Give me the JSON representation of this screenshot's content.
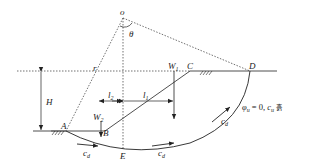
{
  "diagram": {
    "points": {
      "O": {
        "label": "o",
        "x": 123,
        "y": 18
      },
      "A": {
        "label": "A",
        "x": 66,
        "y": 131
      },
      "B": {
        "label": "B",
        "x": 105,
        "y": 131
      },
      "C": {
        "label": "C",
        "x": 190,
        "y": 71
      },
      "D": {
        "label": "D",
        "x": 250,
        "y": 71
      },
      "E": {
        "label": "E",
        "x": 123,
        "y": 150
      }
    },
    "labels": {
      "theta": "θ",
      "radius": "r",
      "height": "H",
      "w1_main": "W",
      "w1_sub": "1",
      "w2_main": "W",
      "w2_sub": "2",
      "l1_main": "l",
      "l1_sub": "1",
      "l2_main": "l",
      "l2_sub": "2",
      "cd_main": "c",
      "cd_sub": "d",
      "soil_phi": "φ",
      "soil_phi_sub": "u",
      "soil_eq": " = 0, ",
      "soil_c": "c",
      "soil_c_sub": "u",
      "soil_word": "흙"
    },
    "colors": {
      "line": "#222222",
      "background": "#ffffff"
    }
  }
}
